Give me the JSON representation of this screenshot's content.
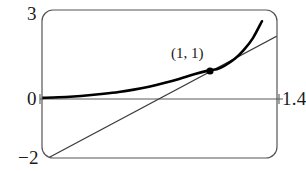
{
  "figure": {
    "kind": "calculator-viewing-window-graph",
    "frame": {
      "shape": "rounded-rectangle",
      "left_px": 42,
      "top_px": 10,
      "right_px": 277,
      "bottom_px": 158,
      "corner_radius_px": 11,
      "stroke": "#555555",
      "stroke_width": 1.2
    },
    "labels": {
      "y_max": "3",
      "y_zero": "0",
      "y_min": "−2",
      "x_max": "1.4"
    },
    "annotation": {
      "point_label": "(1, 1)",
      "point_x": 1,
      "point_y": 1,
      "point_px": [
        210,
        71
      ],
      "dot_radius_px": 3.6,
      "dot_color": "#000000"
    },
    "colors": {
      "curve": "#000000",
      "tangent": "#3b3b3b",
      "axis": "#5a5a5a",
      "frame": "#555555",
      "background": "#ffffff",
      "text": "#1a1a1a"
    }
  },
  "chart_data": {
    "type": "line",
    "title": "",
    "xlabel": "",
    "ylabel": "",
    "xlim": [
      -0.16,
      1.4
    ],
    "ylim": [
      -2,
      3
    ],
    "grid": false,
    "legend": null,
    "axis_lines": {
      "x_axis_at_y": 0,
      "x_axis_pixel_y": 99,
      "x_axis_pixel_span": [
        40,
        283
      ],
      "y_axis_shown": false
    },
    "tick_labels": {
      "y": [
        "3",
        "0",
        "−2"
      ],
      "x": [
        "1.4"
      ]
    },
    "series": [
      {
        "name": "curve",
        "role": "function",
        "style": "thick-solid",
        "color": "#000000",
        "width_px": 2.6,
        "x": [
          -0.16,
          -0.05,
          0.05,
          0.15,
          0.25,
          0.35,
          0.45,
          0.55,
          0.65,
          0.75,
          0.85,
          0.95,
          1.0,
          1.05,
          1.12,
          1.18,
          1.24,
          1.3
        ],
        "y": [
          0.03,
          0.05,
          0.08,
          0.12,
          0.17,
          0.23,
          0.31,
          0.41,
          0.53,
          0.67,
          0.83,
          0.96,
          1.0,
          1.11,
          1.35,
          1.65,
          2.05,
          2.62
        ]
      },
      {
        "name": "tangent",
        "role": "tangent-line-at-point",
        "style": "thin-solid",
        "color": "#3b3b3b",
        "width_px": 1.2,
        "x": [
          -0.12,
          1.4
        ],
        "y": [
          -1.96,
          2.68
        ],
        "pixel_endpoints": [
          [
            48,
            158
          ],
          [
            277,
            36
          ]
        ]
      }
    ],
    "points": [
      {
        "label": "(1, 1)",
        "x": 1,
        "y": 1
      }
    ]
  }
}
